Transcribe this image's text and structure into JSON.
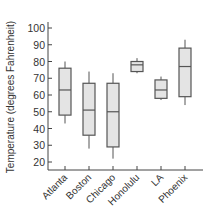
{
  "chart_data": {
    "type": "boxplot",
    "title": "",
    "xlabel": "",
    "ylabel": "Temperature (degrees Fahrenheit)",
    "ylim": [
      20,
      100
    ],
    "yticks": [
      20,
      30,
      40,
      50,
      60,
      70,
      80,
      90,
      100
    ],
    "grid": false,
    "legend": null,
    "categories": [
      "Atlanta",
      "Boston",
      "Chicago",
      "Honolulu",
      "LA",
      "Phoenix"
    ],
    "series": [
      {
        "name": "Atlanta",
        "whisker_low": 43,
        "q1": 48,
        "median": 63,
        "q3": 76,
        "whisker_high": 80
      },
      {
        "name": "Boston",
        "whisker_low": 28,
        "q1": 36,
        "median": 51,
        "q3": 67,
        "whisker_high": 74
      },
      {
        "name": "Chicago",
        "whisker_low": 22,
        "q1": 29,
        "median": 50,
        "q3": 67,
        "whisker_high": 73
      },
      {
        "name": "Honolulu",
        "whisker_low": 73,
        "q1": 74,
        "median": 78,
        "q3": 80,
        "whisker_high": 82
      },
      {
        "name": "LA",
        "whisker_low": 57,
        "q1": 58,
        "median": 63,
        "q3": 69,
        "whisker_high": 71
      },
      {
        "name": "Phoenix",
        "whisker_low": 54,
        "q1": 59,
        "median": 77,
        "q3": 88,
        "whisker_high": 93
      }
    ],
    "colors": {
      "box_fill": "#e4e4e4",
      "box_stroke": "#555555",
      "axis": "#444444",
      "text": "#333333"
    }
  }
}
